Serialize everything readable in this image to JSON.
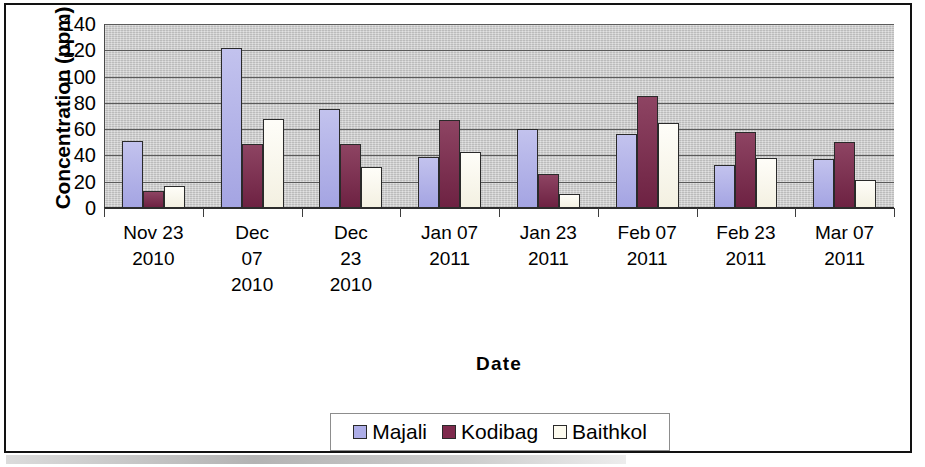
{
  "chart_data": {
    "type": "bar",
    "title": "",
    "subtitle": "",
    "xlabel": "Date",
    "ylabel": "Concentration (ppm)",
    "ylim": [
      0,
      140
    ],
    "yticks": [
      140,
      120,
      100,
      80,
      60,
      40,
      20,
      0
    ],
    "grid": true,
    "legend_position": "bottom",
    "categories": [
      [
        "Nov 23",
        "2010"
      ],
      [
        "Dec",
        "07",
        "2010"
      ],
      [
        "Dec",
        "23",
        "2010"
      ],
      [
        "Jan 07",
        "2011"
      ],
      [
        "Jan 23",
        "2011"
      ],
      [
        "Feb 07",
        "2011"
      ],
      [
        "Feb 23",
        "2011"
      ],
      [
        "Mar 07",
        "2011"
      ]
    ],
    "category_labels_flat": [
      "Nov 23 2010",
      "Dec 07 2010",
      "Dec 23 2010",
      "Jan 07 2011",
      "Jan 23 2011",
      "Feb 07 2011",
      "Feb 23 2011",
      "Mar 07 2011"
    ],
    "series": [
      {
        "name": "Majali",
        "color": "#aeaee8",
        "values": [
          51,
          122,
          75,
          39,
          60,
          56,
          33,
          37
        ]
      },
      {
        "name": "Kodibag",
        "color": "#7e2a4d",
        "values": [
          13,
          49,
          49,
          67,
          26,
          85,
          58,
          50
        ]
      },
      {
        "name": "Baithkol",
        "color": "#fdfbef",
        "values": [
          17,
          68,
          31,
          43,
          11,
          65,
          38,
          21
        ]
      }
    ]
  },
  "axes": {
    "y_title": "Concentration (ppm)",
    "x_title": "Date"
  },
  "legend": {
    "items": [
      {
        "label": "Majali",
        "swatch": "#aeaee8"
      },
      {
        "label": "Kodibag",
        "swatch": "#7e2a4d"
      },
      {
        "label": "Baithkol",
        "swatch": "#fdfbef"
      }
    ]
  },
  "colors": {
    "plot_background": "#c9c9c9",
    "gridline": "#5b5b5b",
    "frame": "#121212",
    "series_majali": "#aeaee8",
    "series_kodibag": "#7e2a4d",
    "series_baithkol": "#fdfbef"
  }
}
